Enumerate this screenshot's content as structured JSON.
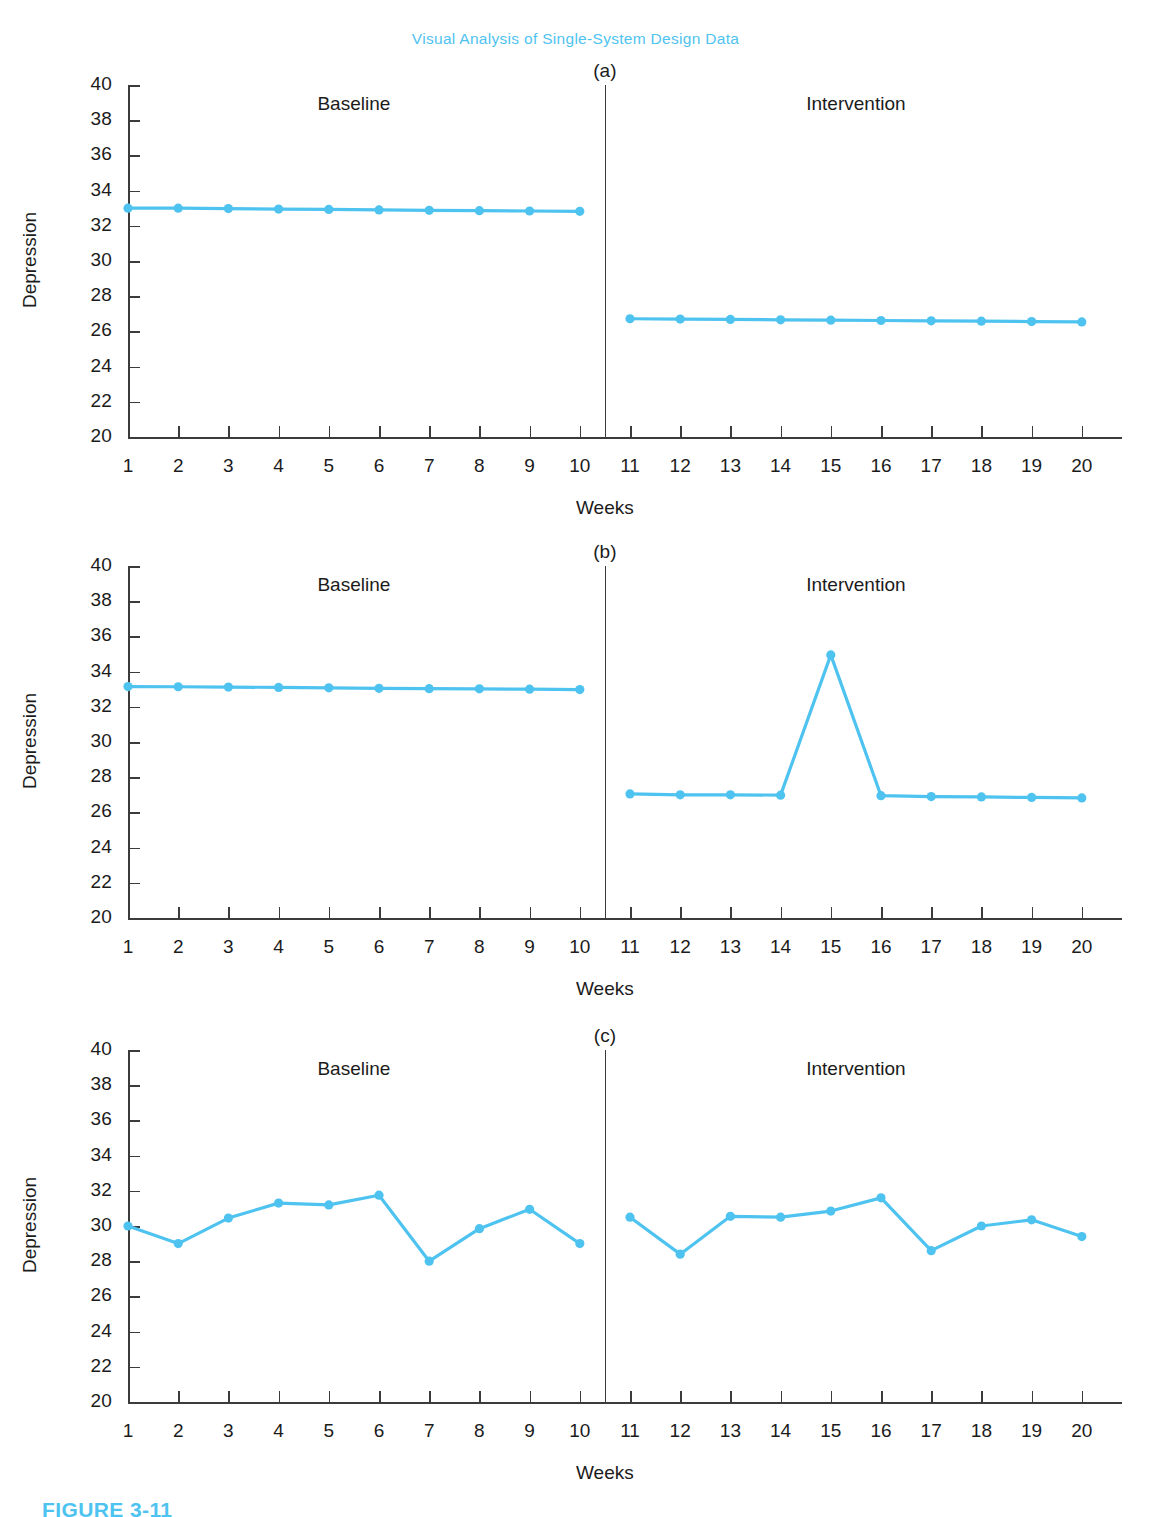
{
  "running_head": "Visual Analysis of Single-System Design Data",
  "figure_caption": "FIGURE 3-11",
  "colors": {
    "series": "#4FC3F0",
    "axis": "#3b3b3b",
    "text": "#1b1b1b",
    "accent": "#4FC3F0",
    "background": "#ffffff"
  },
  "common": {
    "xlabel": "Weeks",
    "ylabel": "Depression",
    "y_ticks": [
      20,
      22,
      24,
      26,
      28,
      30,
      32,
      34,
      36,
      38,
      40
    ],
    "x_ticks": [
      1,
      2,
      3,
      4,
      5,
      6,
      7,
      8,
      9,
      10,
      11,
      12,
      13,
      14,
      15,
      16,
      17,
      18,
      19,
      20
    ],
    "phase_a_label": "Baseline",
    "phase_b_label": "Intervention",
    "phase_change_week": 10.5
  },
  "panels": [
    {
      "letter": "(a)"
    },
    {
      "letter": "(b)"
    },
    {
      "letter": "(c)"
    }
  ],
  "chart_data": [
    {
      "type": "line",
      "panel": "(a)",
      "title": "(a)",
      "xlabel": "Weeks",
      "ylabel": "Depression",
      "ylim": [
        20,
        40
      ],
      "xlim": [
        0.5,
        20.5
      ],
      "grid": false,
      "legend": "none",
      "annotations": [
        "Baseline",
        "Intervention"
      ],
      "phase_change_week": 10.5,
      "series": [
        {
          "name": "Baseline",
          "x": [
            1,
            2,
            3,
            4,
            5,
            6,
            7,
            8,
            9,
            10
          ],
          "values": [
            33.0,
            33.0,
            32.98,
            32.95,
            32.93,
            32.9,
            32.88,
            32.86,
            32.84,
            32.82
          ]
        },
        {
          "name": "Intervention",
          "x": [
            11,
            12,
            13,
            14,
            15,
            16,
            17,
            18,
            19,
            20
          ],
          "values": [
            26.72,
            26.7,
            26.68,
            26.66,
            26.64,
            26.62,
            26.6,
            26.58,
            26.56,
            26.54
          ]
        }
      ]
    },
    {
      "type": "line",
      "panel": "(b)",
      "title": "(b)",
      "xlabel": "Weeks",
      "ylabel": "Depression",
      "ylim": [
        20,
        40
      ],
      "xlim": [
        0.5,
        20.5
      ],
      "grid": false,
      "legend": "none",
      "annotations": [
        "Baseline",
        "Intervention"
      ],
      "phase_change_week": 10.5,
      "series": [
        {
          "name": "Baseline",
          "x": [
            1,
            2,
            3,
            4,
            5,
            6,
            7,
            8,
            9,
            10
          ],
          "values": [
            33.15,
            33.14,
            33.12,
            33.1,
            33.08,
            33.05,
            33.03,
            33.02,
            33.0,
            32.98
          ]
        },
        {
          "name": "Intervention",
          "x": [
            11,
            12,
            13,
            14,
            15,
            16,
            17,
            18,
            19,
            20
          ],
          "values": [
            27.05,
            27.0,
            27.0,
            26.98,
            34.95,
            26.95,
            26.9,
            26.88,
            26.85,
            26.82
          ]
        }
      ]
    },
    {
      "type": "line",
      "panel": "(c)",
      "title": "(c)",
      "xlabel": "Weeks",
      "ylabel": "Depression",
      "ylim": [
        20,
        40
      ],
      "xlim": [
        0.5,
        20.5
      ],
      "grid": false,
      "legend": "none",
      "annotations": [
        "Baseline",
        "Intervention"
      ],
      "phase_change_week": 10.5,
      "series": [
        {
          "name": "Baseline",
          "x": [
            1,
            2,
            3,
            4,
            5,
            6,
            7,
            8,
            9,
            10
          ],
          "values": [
            30.0,
            29.0,
            30.45,
            31.3,
            31.2,
            31.75,
            28.0,
            29.85,
            30.95,
            29.0
          ]
        },
        {
          "name": "Intervention",
          "x": [
            11,
            12,
            13,
            14,
            15,
            16,
            17,
            18,
            19,
            20
          ],
          "values": [
            30.5,
            28.4,
            30.55,
            30.5,
            30.85,
            31.6,
            28.6,
            30.0,
            30.35,
            29.4
          ]
        }
      ]
    }
  ]
}
